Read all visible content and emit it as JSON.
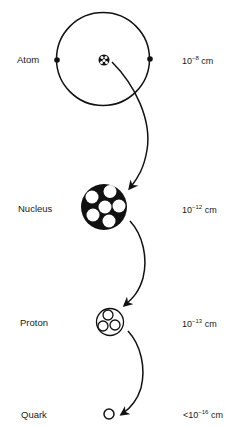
{
  "diagram": {
    "title": "",
    "levels": [
      {
        "name": "Atom",
        "size_prefix": "",
        "size_base": "10",
        "size_exp": "−8",
        "size_unit": " cm"
      },
      {
        "name": "Nucleus",
        "size_prefix": "",
        "size_base": "10",
        "size_exp": "−12",
        "size_unit": " cm"
      },
      {
        "name": "Proton",
        "size_prefix": "",
        "size_base": "10",
        "size_exp": "−13",
        "size_unit": " cm"
      },
      {
        "name": "Quark",
        "size_prefix": "<",
        "size_base": "10",
        "size_exp": "−16",
        "size_unit": " cm"
      }
    ],
    "arrows": [
      {
        "from": "Atom",
        "to": "Nucleus"
      },
      {
        "from": "Nucleus",
        "to": "Proton"
      },
      {
        "from": "Proton",
        "to": "Quark"
      }
    ],
    "stroke_color": "#111111",
    "background": "#ffffff"
  }
}
